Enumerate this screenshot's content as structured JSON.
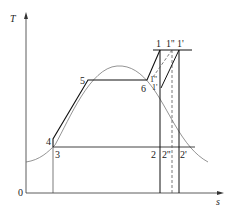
{
  "diagram": {
    "type": "T-s diagram",
    "axes": {
      "y_label": "T",
      "x_label": "s",
      "origin_label": "0"
    },
    "points": [
      {
        "id": "p1",
        "label": "1",
        "x": 160,
        "y": 50
      },
      {
        "id": "p1pp",
        "label": "1''",
        "x": 172,
        "y": 50
      },
      {
        "id": "p1p",
        "label": "1'",
        "x": 179,
        "y": 50
      },
      {
        "id": "p2",
        "label": "2",
        "x": 160,
        "y": 147
      },
      {
        "id": "p2pp",
        "label": "2''",
        "x": 172,
        "y": 147
      },
      {
        "id": "p2p",
        "label": "2'",
        "x": 179,
        "y": 147
      },
      {
        "id": "p3",
        "label": "3",
        "x": 53,
        "y": 147
      },
      {
        "id": "p4",
        "label": "4",
        "x": 53,
        "y": 139
      },
      {
        "id": "p5",
        "label": "5",
        "x": 88,
        "y": 80
      },
      {
        "id": "p6",
        "label": "6",
        "x": 147,
        "y": 80
      },
      {
        "id": "p1dd",
        "label": "1''",
        "x": 153,
        "y": 77
      },
      {
        "id": "p1d",
        "label": "1'",
        "x": 161,
        "y": 88
      }
    ],
    "labels": {
      "T": "T",
      "s": "s",
      "zero": "0",
      "l1": "1",
      "l1pp": "1''",
      "l1p": "1'",
      "l2": "2",
      "l2pp": "2''",
      "l2p": "2'",
      "l3": "3",
      "l4": "4",
      "l5": "5",
      "l6": "6",
      "l1dd": "1''",
      "l1d": "1'"
    }
  }
}
